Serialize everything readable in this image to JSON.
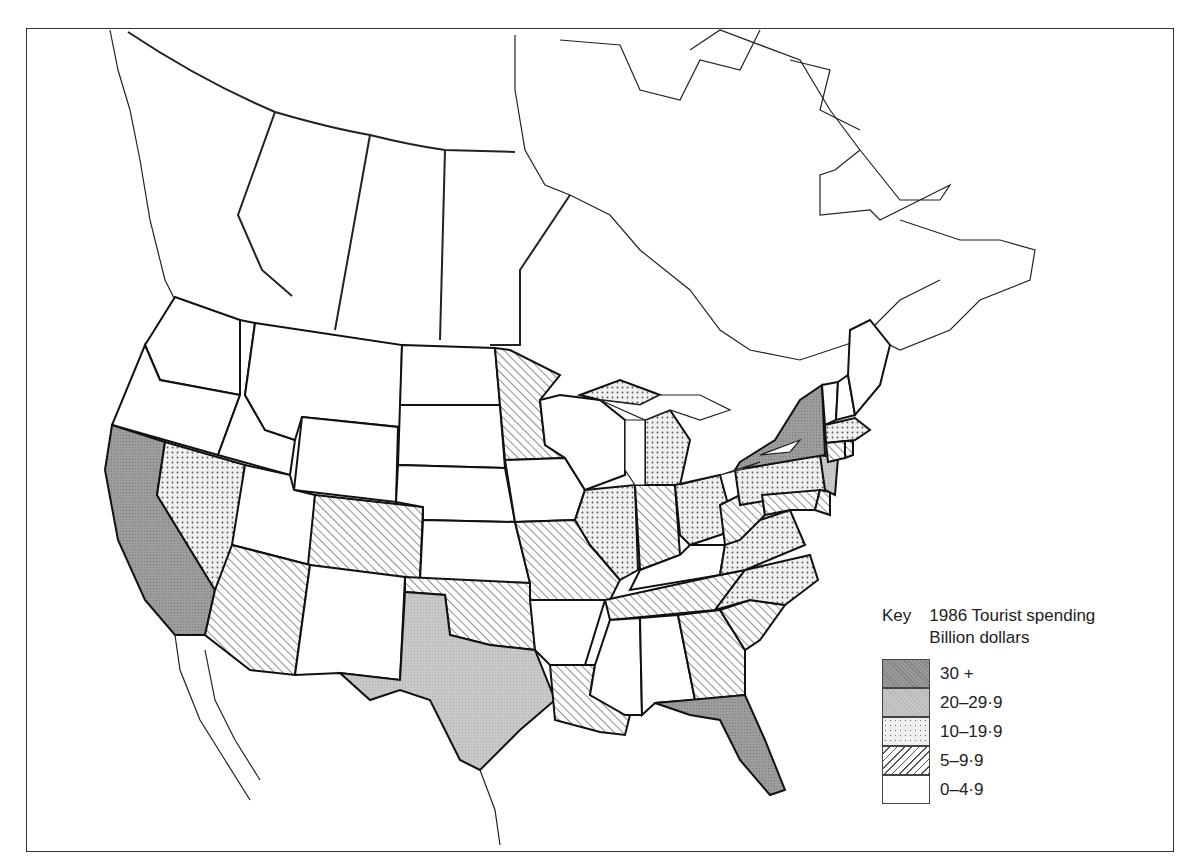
{
  "map": {
    "title_visible": "",
    "subject": "1986 Tourist spending by state (USA)",
    "region": "North America (USA states shaded, Canada outline)"
  },
  "legend": {
    "key_label": "Key",
    "title_line1": "1986 Tourist spending",
    "title_line2": "Billion dollars",
    "classes": [
      {
        "id": "c30",
        "label": "30 +",
        "fill": "#9a9a9a",
        "pattern": "dense-dark-grey"
      },
      {
        "id": "c20",
        "label": "20–29·9",
        "fill": "#c6c6c6",
        "pattern": "light-grey"
      },
      {
        "id": "c10",
        "label": "10–19·9",
        "fill": "#f0f0f0",
        "pattern": "dots"
      },
      {
        "id": "c5",
        "label": "5–9·9",
        "fill": "#ffffff",
        "pattern": "diagonal-hatch"
      },
      {
        "id": "c0",
        "label": "0–4·9",
        "fill": "#ffffff",
        "pattern": "none"
      }
    ]
  },
  "states": {
    "California": "c30",
    "New York": "c30",
    "Florida": "c30",
    "Texas": "c20",
    "New Jersey": "c20",
    "Nevada": "c10",
    "Michigan": "c10",
    "Illinois": "c10",
    "Ohio": "c10",
    "Pennsylvania": "c10",
    "Virginia": "c10",
    "North Carolina": "c10",
    "Massachusetts": "c10",
    "Minnesota": "c5",
    "Arizona": "c5",
    "Colorado": "c5",
    "Oklahoma": "c5",
    "Missouri": "c5",
    "Indiana": "c5",
    "West Virginia": "c5",
    "Tennessee": "c5",
    "Louisiana": "c5",
    "Georgia": "c5",
    "South Carolina": "c5",
    "Maryland": "c5",
    "Delaware": "c5",
    "Connecticut": "c5",
    "Rhode Island": "c5",
    "Washington": "c0",
    "Oregon": "c0",
    "Idaho": "c0",
    "Montana": "c0",
    "Wyoming": "c0",
    "Utah": "c0",
    "New Mexico": "c0",
    "North Dakota": "c0",
    "South Dakota": "c0",
    "Nebraska": "c0",
    "Kansas": "c0",
    "Iowa": "c0",
    "Wisconsin": "c0",
    "Kentucky": "c0",
    "Arkansas": "c0",
    "Mississippi": "c0",
    "Alabama": "c0",
    "Vermont": "c0",
    "New Hampshire": "c0",
    "Maine": "c0"
  }
}
